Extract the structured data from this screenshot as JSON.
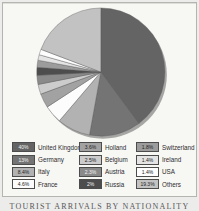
{
  "figure": {
    "caption": "TOURIST ARRIVALS BY NATIONALITY"
  },
  "chart_data": {
    "type": "pie",
    "title": "TOURIST ARRIVALS BY NATIONALITY",
    "direction": "clockwise",
    "start_angle": "12-oclock",
    "legend_position": "bottom",
    "grid": false,
    "legend_columns": [
      [
        0,
        1,
        2,
        3
      ],
      [
        4,
        5,
        6,
        7
      ],
      [
        8,
        9,
        10,
        11
      ]
    ],
    "slices": [
      {
        "label": "United Kingdom",
        "value": 40,
        "display": "40%",
        "color": "#646464",
        "text": "#f2f2f2"
      },
      {
        "label": "Germany",
        "value": 13,
        "display": "13%",
        "color": "#747474",
        "text": "#f2f2f2"
      },
      {
        "label": "Italy",
        "value": 8.4,
        "display": "8.4%",
        "color": "#b2b2b2",
        "text": "#222222"
      },
      {
        "label": "France",
        "value": 4.6,
        "display": "4.6%",
        "color": "#fcfcfc",
        "text": "#222222"
      },
      {
        "label": "Holland",
        "value": 3.6,
        "display": "3.6%",
        "color": "#a2a2a2",
        "text": "#222222"
      },
      {
        "label": "Belgium",
        "value": 2.5,
        "display": "2.5%",
        "color": "#cccccc",
        "text": "#222222"
      },
      {
        "label": "Austria",
        "value": 2.3,
        "display": "2.3%",
        "color": "#8a8a8a",
        "text": "#f2f2f2"
      },
      {
        "label": "Russia",
        "value": 2,
        "display": "2%",
        "color": "#4d4d4d",
        "text": "#f2f2f2"
      },
      {
        "label": "Switzerland",
        "value": 1.8,
        "display": "1.8%",
        "color": "#9c9c9c",
        "text": "#222222"
      },
      {
        "label": "Ireland",
        "value": 1.4,
        "display": "1.4%",
        "color": "#e4e4e4",
        "text": "#222222"
      },
      {
        "label": "USA",
        "value": 1.4,
        "display": "1.4%",
        "color": "#fdfdfd",
        "text": "#222222"
      },
      {
        "label": "Others",
        "value": 19.3,
        "display": "19.3%",
        "color": "#c2c2c2",
        "text": "#222222"
      }
    ]
  }
}
